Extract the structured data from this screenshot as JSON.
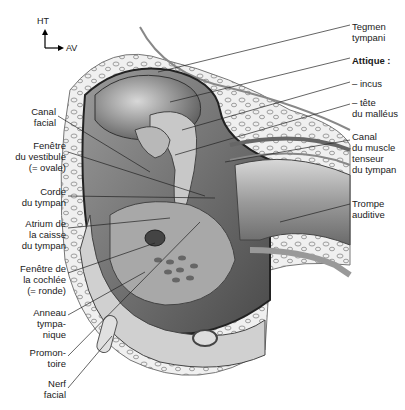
{
  "diagram": {
    "orientation": {
      "up": "HT",
      "forward": "AV"
    },
    "labels_left": [
      {
        "text": "Canal\nfacial",
        "x": 4,
        "y": 106,
        "w": 52
      },
      {
        "text": "Fenêtre\ndu vestibule\n(= ovale)",
        "x": 4,
        "y": 140,
        "w": 62
      },
      {
        "text": "Corde\ndu tympan",
        "x": 4,
        "y": 186,
        "w": 62
      },
      {
        "text": "Atrium de\nla caisse\ndu tympan",
        "x": 4,
        "y": 218,
        "w": 62
      },
      {
        "text": "Fenêtre de\nla cochlée\n(= ronde)",
        "x": 4,
        "y": 263,
        "w": 62
      },
      {
        "text": "Anneau\ntympa-\nnique",
        "x": 4,
        "y": 307,
        "w": 62
      },
      {
        "text": "Promon-\ntoire",
        "x": 4,
        "y": 347,
        "w": 62
      },
      {
        "text": "Nerf\nfacial",
        "x": 4,
        "y": 378,
        "w": 62
      }
    ],
    "labels_right": [
      {
        "text": "Tegmen\ntympani",
        "x": 352,
        "y": 21,
        "bold": false
      },
      {
        "text": "Attique :",
        "x": 352,
        "y": 55,
        "bold": true
      },
      {
        "text": "– incus",
        "x": 352,
        "y": 78,
        "bold": false
      },
      {
        "text": "– tête\ndu malléus",
        "x": 352,
        "y": 97,
        "bold": false
      },
      {
        "text": "Canal\ndu muscle\ntenseur\ndu tympan",
        "x": 352,
        "y": 131,
        "bold": false
      },
      {
        "text": "Trompe\nauditive",
        "x": 352,
        "y": 198,
        "bold": false
      }
    ],
    "leader_lines": [
      [
        158,
        72,
        350,
        25
      ],
      [
        170,
        102,
        350,
        58
      ],
      [
        182,
        130,
        350,
        82
      ],
      [
        175,
        155,
        350,
        104
      ],
      [
        225,
        162,
        350,
        140
      ],
      [
        280,
        222,
        350,
        204
      ],
      [
        58,
        116,
        150,
        172
      ],
      [
        68,
        152,
        205,
        196
      ],
      [
        68,
        196,
        215,
        198
      ],
      [
        68,
        228,
        170,
        218
      ],
      [
        68,
        273,
        155,
        243
      ],
      [
        68,
        315,
        145,
        272
      ],
      [
        68,
        356,
        200,
        222
      ],
      [
        68,
        388,
        112,
        336
      ]
    ],
    "colors": {
      "bone_light": "#e8e8e8",
      "bone_dark": "#9a9a9a",
      "cavity": "#6e6e6e",
      "line": "#222222"
    }
  }
}
